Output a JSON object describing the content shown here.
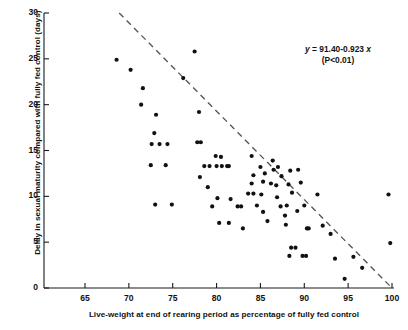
{
  "chart_data": {
    "type": "scatter",
    "title": "",
    "xlabel": "Live-weight at end of rearing period as percentage of fully fed control",
    "ylabel": "Delay in sexual maturity compared with fully fed control (days)",
    "xlim": [
      65,
      100
    ],
    "ylim": [
      0,
      30
    ],
    "xticks": [
      65,
      70,
      75,
      80,
      85,
      90,
      95,
      100
    ],
    "yticks": [
      0,
      5,
      10,
      15,
      20,
      25,
      30
    ],
    "grid": false,
    "legend": null,
    "annotation": {
      "equation": "y = 91.40-0.923x",
      "significance": "(P<0.01)",
      "intercept": 91.4,
      "slope": -0.923
    },
    "fit_line": {
      "style": "dashed",
      "color": "#555555",
      "x_start": 68.9,
      "y_start": 30.0,
      "x_end": 100.0,
      "y_end": 0.0
    },
    "marker": {
      "shape": "circle",
      "color": "#111111",
      "size_px": 4.1
    },
    "points": [
      [
        68.6,
        24.9
      ],
      [
        70.2,
        23.8
      ],
      [
        71.6,
        21.8
      ],
      [
        71.4,
        20.0
      ],
      [
        73.1,
        18.9
      ],
      [
        72.9,
        16.9
      ],
      [
        72.6,
        15.7
      ],
      [
        73.5,
        15.7
      ],
      [
        74.4,
        15.7
      ],
      [
        72.5,
        13.4
      ],
      [
        74.2,
        13.4
      ],
      [
        73.0,
        9.1
      ],
      [
        74.9,
        9.1
      ],
      [
        77.5,
        25.8
      ],
      [
        76.2,
        22.9
      ],
      [
        78.0,
        19.2
      ],
      [
        77.8,
        15.9
      ],
      [
        78.2,
        15.9
      ],
      [
        79.9,
        14.4
      ],
      [
        80.5,
        14.3
      ],
      [
        78.6,
        13.3
      ],
      [
        79.2,
        13.3
      ],
      [
        80.0,
        13.3
      ],
      [
        80.6,
        13.3
      ],
      [
        81.2,
        13.3
      ],
      [
        81.4,
        13.3
      ],
      [
        78.1,
        12.1
      ],
      [
        79.0,
        11.0
      ],
      [
        80.1,
        9.8
      ],
      [
        81.6,
        9.7
      ],
      [
        79.5,
        8.9
      ],
      [
        82.4,
        8.9
      ],
      [
        82.8,
        8.9
      ],
      [
        80.3,
        7.1
      ],
      [
        81.4,
        7.1
      ],
      [
        83.0,
        6.5
      ],
      [
        84.0,
        14.4
      ],
      [
        84.2,
        12.3
      ],
      [
        84.0,
        11.4
      ],
      [
        83.6,
        10.3
      ],
      [
        84.2,
        10.3
      ],
      [
        85.1,
        10.2
      ],
      [
        85.0,
        13.2
      ],
      [
        85.5,
        12.5
      ],
      [
        85.3,
        11.6
      ],
      [
        84.6,
        9.0
      ],
      [
        85.3,
        8.3
      ],
      [
        85.8,
        7.3
      ],
      [
        86.4,
        13.9
      ],
      [
        86.5,
        12.9
      ],
      [
        86.2,
        11.4
      ],
      [
        86.8,
        11.2
      ],
      [
        87.0,
        13.2
      ],
      [
        87.4,
        12.2
      ],
      [
        86.9,
        9.9
      ],
      [
        87.3,
        8.9
      ],
      [
        87.8,
        7.9
      ],
      [
        87.9,
        6.9
      ],
      [
        88.4,
        12.8
      ],
      [
        88.2,
        11.3
      ],
      [
        88.6,
        10.4
      ],
      [
        88.0,
        9.0
      ],
      [
        88.5,
        4.4
      ],
      [
        89.0,
        4.4
      ],
      [
        88.3,
        3.5
      ],
      [
        89.3,
        12.9
      ],
      [
        89.6,
        11.5
      ],
      [
        89.2,
        8.4
      ],
      [
        90.0,
        9.0
      ],
      [
        90.3,
        6.5
      ],
      [
        90.5,
        6.5
      ],
      [
        89.8,
        3.5
      ],
      [
        90.2,
        3.5
      ],
      [
        91.5,
        10.2
      ],
      [
        92.1,
        6.8
      ],
      [
        93.0,
        5.9
      ],
      [
        93.5,
        3.2
      ],
      [
        94.6,
        1.0
      ],
      [
        95.6,
        3.4
      ],
      [
        96.6,
        2.2
      ],
      [
        99.6,
        10.2
      ],
      [
        99.8,
        4.9
      ]
    ]
  }
}
